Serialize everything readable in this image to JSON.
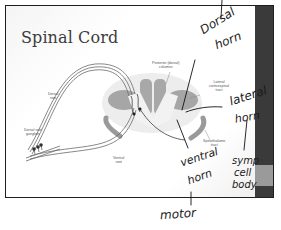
{
  "slide": {
    "title": "Spinal Cord",
    "colors": {
      "frame": "#1e1e1e",
      "side_strip": "#3a3a3a",
      "side_strip_block": "#9a9a9a",
      "gray_matter": "#9c9c9c",
      "white_matter": "#c8c8c8",
      "posterior_columns": "#a8a8a8",
      "handwriting": "#1a1a1a"
    }
  },
  "diagram": {
    "labels": {
      "dorsal_root": "Dorsal\nroot",
      "dorsal_root_ganglion": "Dorsal root\nganglion",
      "ventral_root": "Ventral\nroot",
      "posterior_columns": "Posterior (dorsal)\ncolumns",
      "lateral_corticospinal_tract": "Lateral\ncorticospinal\ntract",
      "spinothalamic_tract": "Spinothalamic\ntract"
    }
  },
  "annotations": {
    "dorsal_horn": [
      "Dorsal",
      "horn"
    ],
    "lateral_horn": [
      "lateral",
      "horn"
    ],
    "ventral_horn": [
      "ventral",
      "horn"
    ],
    "symp_cell_body": [
      "symp",
      "cell",
      "body"
    ],
    "motor": "motor"
  }
}
